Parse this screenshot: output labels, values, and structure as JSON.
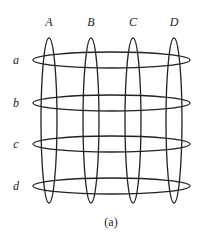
{
  "figure": {
    "caption": "(a)",
    "columns": [
      {
        "label": "A",
        "cx": 49
      },
      {
        "label": "B",
        "cx": 91
      },
      {
        "label": "C",
        "cx": 133
      },
      {
        "label": "D",
        "cx": 174
      }
    ],
    "rows": [
      {
        "label": "a",
        "cy": 60
      },
      {
        "label": "b",
        "cy": 103
      },
      {
        "label": "c",
        "cy": 144
      },
      {
        "label": "d",
        "cy": 186
      }
    ],
    "stroke_color": "#222222"
  }
}
